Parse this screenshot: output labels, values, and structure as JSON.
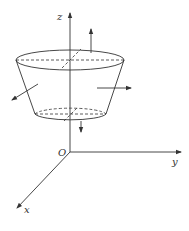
{
  "diagram": {
    "type": "3d-surface-normals",
    "labels": {
      "z_axis": "z",
      "y_axis": "y",
      "x_axis": "x",
      "origin": "O"
    },
    "colors": {
      "stroke": "#333333",
      "background": "#ffffff"
    },
    "normals": [
      {
        "surface": "top",
        "direction": "up"
      },
      {
        "surface": "lateral-right",
        "direction": "right"
      },
      {
        "surface": "lateral-left",
        "direction": "down-left"
      },
      {
        "surface": "bottom",
        "direction": "down"
      }
    ]
  }
}
